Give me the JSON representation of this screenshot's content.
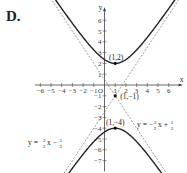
{
  "label": "D.",
  "chart_data": {
    "type": "line",
    "title": "",
    "xlabel": "x",
    "ylabel": "y",
    "xlim": [
      -6.5,
      7.5
    ],
    "ylim": [
      -8,
      7.5
    ],
    "x_ticks": [
      -6,
      -5,
      -4,
      -3,
      -2,
      -1,
      1,
      2,
      3,
      4,
      5,
      6
    ],
    "y_ticks": [
      -7,
      -6,
      -5,
      -4,
      -3,
      -2,
      -1,
      1,
      2,
      3,
      4,
      5,
      6
    ],
    "origin_label": "O",
    "grid": false,
    "curve": {
      "name": "hyperbola",
      "equation": "(y+1)^2/9 - (x-1)^2/4 = 1",
      "center": [
        1,
        -1
      ],
      "vertices": [
        [
          1,
          2
        ],
        [
          1,
          -4
        ]
      ]
    },
    "asymptotes": [
      {
        "name": "y = (3/2)x - 5/2",
        "slope": 1.5,
        "intercept": -2.5
      },
      {
        "name": "y = -(3/2)x + 1/2",
        "slope": -1.5,
        "intercept": 0.5
      }
    ],
    "points": [
      {
        "label": "(1,2)",
        "x": 1,
        "y": 2
      },
      {
        "label": "(1,-1)",
        "x": 1,
        "y": -1
      },
      {
        "label": "(1,-4)",
        "x": 1,
        "y": -4
      }
    ],
    "annotations": [
      {
        "text": "y = -3/2 x + 1/2",
        "position": "right"
      },
      {
        "text": "y = 3/2 x - 5/2",
        "position": "lower-left"
      }
    ]
  }
}
